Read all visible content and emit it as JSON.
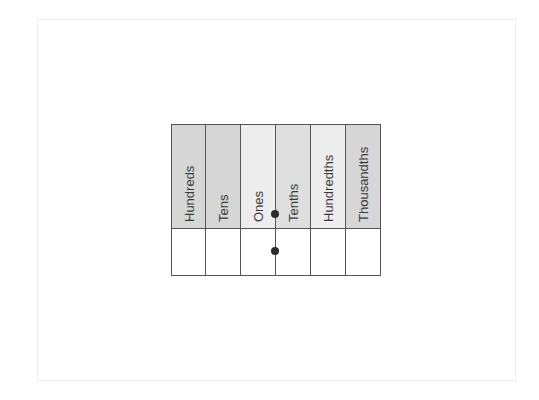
{
  "diagram": {
    "title": "",
    "columns": [
      {
        "label": "Hundreds",
        "color": "#d6d6d6"
      },
      {
        "label": "Tens",
        "color": "#d6d6d6"
      },
      {
        "label": "Ones",
        "color": "#ededed"
      },
      {
        "label": "Tenths",
        "color": "#dedede"
      },
      {
        "label": "Hundredths",
        "color": "#ededed"
      },
      {
        "label": "Thousandths",
        "color": "#d6d6d6"
      }
    ],
    "body_row_values": [
      "",
      "",
      "",
      "",
      "",
      ""
    ],
    "decimal_point_markers": [
      {
        "position": "between Ones and Tenths",
        "row": "header"
      },
      {
        "position": "between Ones and Tenths",
        "row": "body"
      }
    ],
    "border_color": "#555555",
    "dot_color": "#2b2b2b"
  }
}
